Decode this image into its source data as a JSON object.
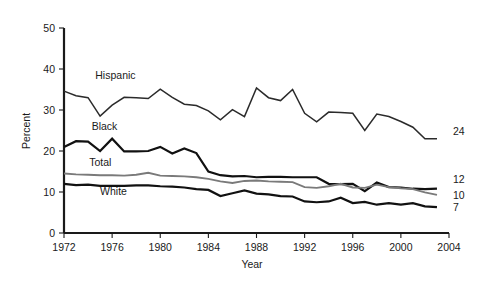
{
  "chart_data": {
    "type": "line",
    "title": "",
    "xlabel": "Year",
    "ylabel": "Percent",
    "xlim": [
      1972,
      2004
    ],
    "ylim": [
      0,
      50
    ],
    "grid": false,
    "legend_position": "inline-labels",
    "xticks": [
      "1972",
      "1976",
      "1980",
      "1984",
      "1988",
      "1992",
      "1996",
      "2000",
      "2004"
    ],
    "xtick_values": [
      1972,
      1976,
      1980,
      1984,
      1988,
      1992,
      1996,
      2000,
      2004
    ],
    "yticks": [
      "0",
      "10",
      "20",
      "30",
      "40",
      "50"
    ],
    "ytick_values": [
      0,
      10,
      20,
      30,
      40,
      50
    ],
    "x": [
      1972,
      1973,
      1974,
      1975,
      1976,
      1977,
      1978,
      1979,
      1980,
      1981,
      1982,
      1983,
      1984,
      1985,
      1986,
      1987,
      1988,
      1989,
      1990,
      1991,
      1992,
      1993,
      1994,
      1995,
      1996,
      1997,
      1998,
      1999,
      2000,
      2001,
      2002,
      2003
    ],
    "series": [
      {
        "name": "Hispanic",
        "color": "#2b2b2b",
        "width": 1.5,
        "end_label": "24",
        "label_x": 1974.6,
        "label_y": 37.6,
        "values": [
          34.6,
          33.5,
          33.0,
          28.5,
          31.2,
          33.1,
          33.0,
          32.8,
          35.1,
          33.1,
          31.4,
          31.1,
          29.8,
          27.6,
          30.1,
          28.4,
          35.4,
          33.0,
          32.3,
          35.0,
          29.2,
          27.1,
          29.5,
          29.4,
          29.2,
          25.0,
          29.0,
          28.4,
          27.2,
          25.8,
          23.0,
          23.0
        ]
      },
      {
        "name": "Black",
        "color": "#111111",
        "width": 2.2,
        "end_label": "",
        "label_x": 1974.3,
        "label_y": 25.2,
        "values": [
          21.0,
          22.4,
          22.3,
          20.0,
          23.0,
          19.9,
          19.9,
          20.0,
          21.0,
          19.4,
          20.6,
          19.5,
          15.0,
          14.1,
          13.8,
          13.9,
          13.6,
          13.7,
          13.7,
          13.6,
          13.6,
          13.6,
          12.0,
          11.9,
          12.0,
          10.2,
          12.3,
          11.2,
          11.1,
          10.8,
          10.7,
          10.8
        ]
      },
      {
        "name": "Total",
        "color": "#7a7a7a",
        "width": 1.9,
        "end_label": "10",
        "label_x": 1974.1,
        "label_y": 16.3,
        "values": [
          14.5,
          14.3,
          14.2,
          14.1,
          14.1,
          14.0,
          14.2,
          14.7,
          14.0,
          13.9,
          13.8,
          13.6,
          13.2,
          12.6,
          12.2,
          12.7,
          12.8,
          12.6,
          12.5,
          12.4,
          11.2,
          11.0,
          11.4,
          12.0,
          11.1,
          11.0,
          11.8,
          11.2,
          10.9,
          10.7,
          9.9,
          9.3
        ]
      },
      {
        "name": "White",
        "color": "#111111",
        "width": 2.2,
        "end_label": "7",
        "label_x": 1975.0,
        "label_y": 9.2,
        "values": [
          12.0,
          11.7,
          11.8,
          11.5,
          11.5,
          11.5,
          11.6,
          11.6,
          11.4,
          11.3,
          11.1,
          10.7,
          10.5,
          9.0,
          9.7,
          10.4,
          9.6,
          9.4,
          9.0,
          8.9,
          7.7,
          7.5,
          7.7,
          8.6,
          7.3,
          7.6,
          6.9,
          7.3,
          6.9,
          7.3,
          6.5,
          6.3
        ]
      }
    ],
    "end_labels": [
      {
        "text": "24",
        "series": "Hispanic",
        "y": 24
      },
      {
        "text": "12",
        "series": "Black",
        "y": 12
      },
      {
        "text": "10",
        "series": "Total",
        "y": 10
      },
      {
        "text": "7",
        "series": "White",
        "y": 7
      }
    ]
  }
}
